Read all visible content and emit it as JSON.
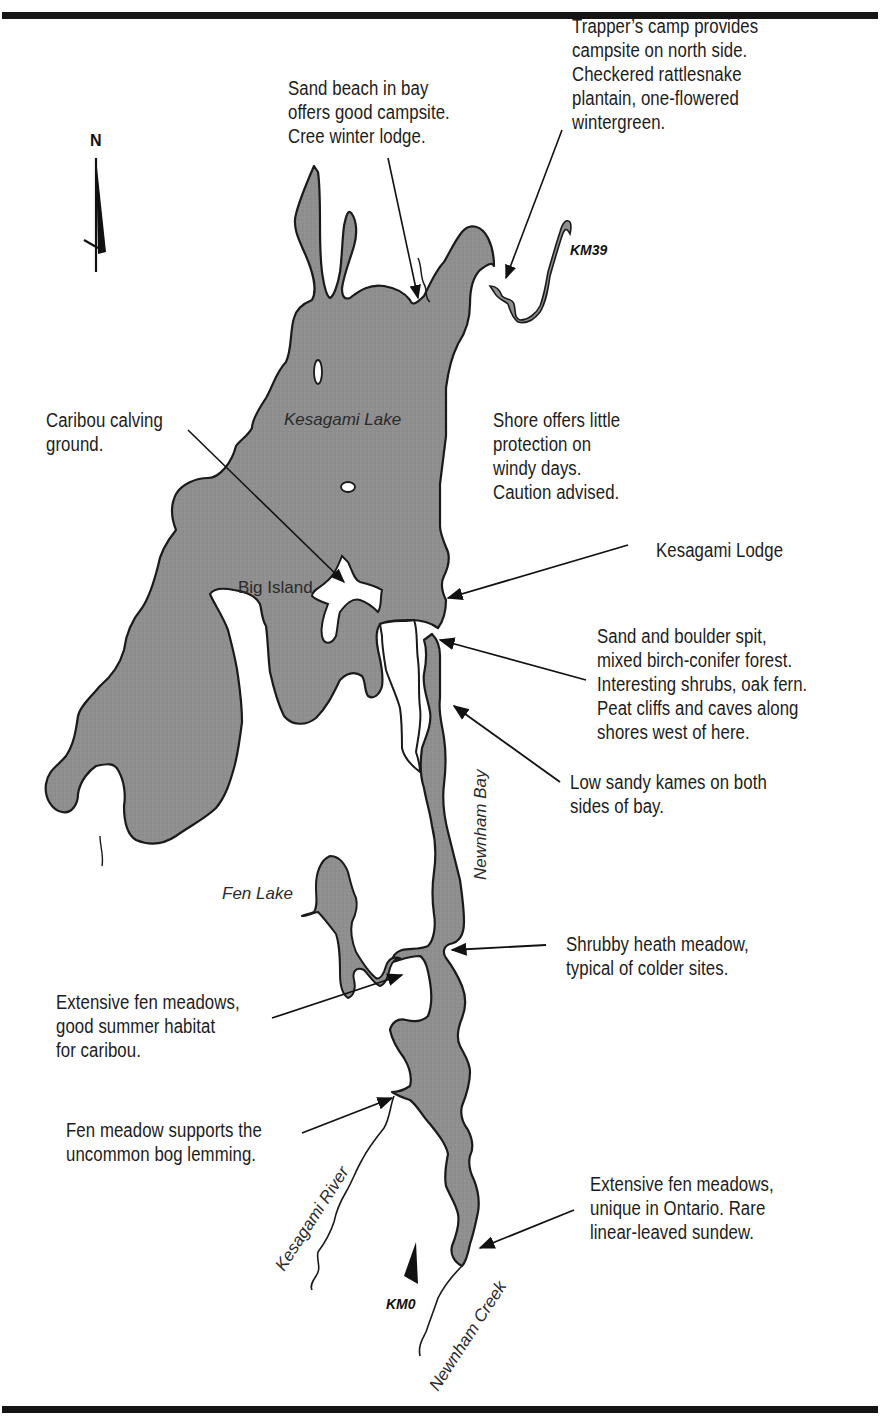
{
  "map": {
    "colors": {
      "water": "#8e8e8e",
      "shore": "#1a1a1a",
      "land": "#ffffff",
      "rule": "#141414"
    },
    "compass": {
      "label": "N",
      "icon": "north-arrow-icon"
    },
    "markers": {
      "km39": "KM39",
      "km0": "KM0"
    },
    "places": {
      "kesagami_lake": "Kesagami Lake",
      "big_island": "Big Island",
      "fen_lake": "Fen Lake",
      "newnham_bay": "Newnham Bay",
      "kesagami_river": "Kesagami River",
      "newnham_creek": "Newnham Creek"
    },
    "annotations": [
      {
        "id": "sand-beach",
        "text": "Sand beach in bay\noffers good campsite.\nCree winter lodge."
      },
      {
        "id": "trappers-camp",
        "text": "Trapper’s camp provides\ncampsite on north side.\nCheckered rattlesnake\nplantain, one-flowered\nwintergreen."
      },
      {
        "id": "caribou-calving",
        "text": "Caribou calving\nground."
      },
      {
        "id": "shore-protection",
        "text": "Shore offers little\nprotection on\nwindy days.\nCaution advised."
      },
      {
        "id": "kesagami-lodge",
        "text": "Kesagami Lodge"
      },
      {
        "id": "sand-boulder-spit",
        "text": "Sand and boulder spit,\nmixed birch-conifer forest.\nInteresting shrubs, oak fern.\nPeat cliffs and caves along\nshores west of here."
      },
      {
        "id": "sandy-kames",
        "text": "Low sandy kames on both\nsides of bay."
      },
      {
        "id": "shrubby-heath",
        "text": "Shrubby heath meadow,\ntypical of colder sites."
      },
      {
        "id": "fen-meadows-caribou",
        "text": "Extensive fen meadows,\ngood summer habitat\nfor caribou."
      },
      {
        "id": "bog-lemming",
        "text": "Fen meadow supports the\nuncommon bog lemming."
      },
      {
        "id": "fen-meadows-ontario",
        "text": "Extensive fen meadows,\nunique in Ontario. Rare\nlinear-leaved sundew."
      }
    ]
  }
}
